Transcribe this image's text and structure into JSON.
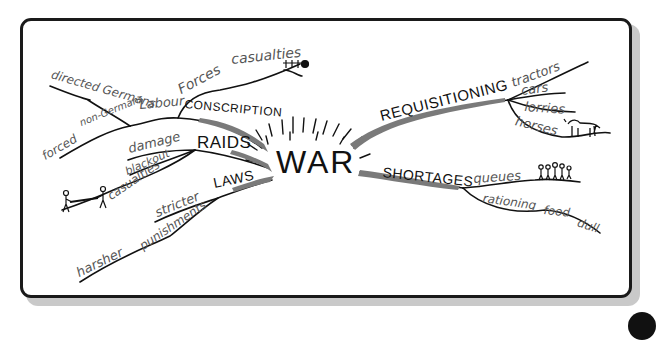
{
  "diagram": {
    "type": "mind-map",
    "center": {
      "label": "WAR"
    },
    "branches": [
      {
        "label": "CONSCRIPTION",
        "children": [
          {
            "label": "Forces",
            "children": [
              {
                "label": "casualties",
                "icon": "graves-icon"
              }
            ]
          },
          {
            "label": "Labour",
            "children": [
              {
                "label": "directed Germans"
              },
              {
                "label": "forced non-Germans"
              }
            ]
          }
        ]
      },
      {
        "label": "RAIDS",
        "children": [
          {
            "label": "damage"
          },
          {
            "label": "blackout"
          },
          {
            "label": "casualties",
            "icon": "stretcher-bearers-icon"
          }
        ]
      },
      {
        "label": "LAWS",
        "children": [
          {
            "label": "stricter"
          },
          {
            "label": "punishments",
            "children": [
              {
                "label": "harsher"
              }
            ]
          }
        ]
      },
      {
        "label": "REQUISITIONING",
        "children": [
          {
            "label": "tractors"
          },
          {
            "label": "cars"
          },
          {
            "label": "lorries"
          },
          {
            "label": "horses",
            "icon": "horse-icon"
          }
        ]
      },
      {
        "label": "SHORTAGES",
        "children": [
          {
            "label": "queues",
            "icon": "people-queue-icon"
          },
          {
            "label": "rationing",
            "children": [
              {
                "label": "food",
                "children": [
                  {
                    "label": "dull"
                  }
                ]
              }
            ]
          }
        ]
      }
    ]
  },
  "labels": {
    "war": "WAR",
    "conscription": "CONSCRIPTION",
    "forces": "Forces",
    "casualties_forces": "casualties",
    "labour": "Labour",
    "directed_germans": "directed Germans",
    "forced": "forced",
    "non_germans": "non-Germans",
    "raids": "RAIDS",
    "damage": "damage",
    "blackout": "blackout",
    "casualties_raids": "casualties",
    "laws": "LAWS",
    "stricter": "stricter",
    "punishments": "punishments",
    "harsher": "harsher",
    "requisitioning": "REQUISITIONING",
    "tractors": "tractors",
    "cars": "cars",
    "lorries": "lorries",
    "horses": "horses",
    "shortages": "SHORTAGES",
    "queues": "queues",
    "rationing": "rationing",
    "food": "food",
    "dull": "dull"
  },
  "colors": {
    "ink": "#111111",
    "sub_ink": "#555555",
    "branch_fill": "#7a7a7a",
    "frame_shadow": "#c9c9c9"
  }
}
